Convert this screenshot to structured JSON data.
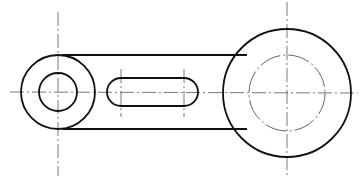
{
  "figure": {
    "type": "mechanical-drawing",
    "cropped_header_text": "",
    "colors": {
      "outline": "#111111",
      "centerline": "#555555",
      "hidden": "#555555",
      "background": "#ffffff"
    },
    "left_boss": {
      "cx": 58,
      "cy": 92,
      "outer_r": 37,
      "inner_r": 20
    },
    "right_boss": {
      "cx": 287,
      "cy": 93,
      "outer_r": 64,
      "inner_r_dashdot": 38
    },
    "connecting_bar": {
      "top_y": 55,
      "bottom_y": 130
    },
    "slot": {
      "x1": 121,
      "x2": 185,
      "cy": 92,
      "r": 14
    }
  }
}
